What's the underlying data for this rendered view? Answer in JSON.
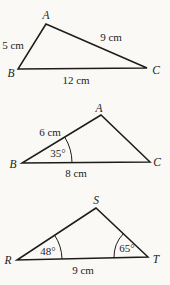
{
  "figure1": {
    "vertex_top": "A",
    "vertex_left": "B",
    "vertex_right": "C",
    "side_left": "5 cm",
    "side_right": "9 cm",
    "side_bottom": "12 cm"
  },
  "figure2": {
    "vertex_top": "A",
    "vertex_left": "B",
    "vertex_right": "C",
    "side_left": "6 cm",
    "side_bottom": "8 cm",
    "angle_left": "35°"
  },
  "figure3": {
    "vertex_top": "S",
    "vertex_left": "R",
    "vertex_right": "T",
    "side_bottom": "9 cm",
    "angle_left": "48°",
    "angle_right": "65°"
  },
  "colors": {
    "line": "#1d1c1a",
    "text": "#1d1c1a",
    "background": "#faf9f6"
  }
}
